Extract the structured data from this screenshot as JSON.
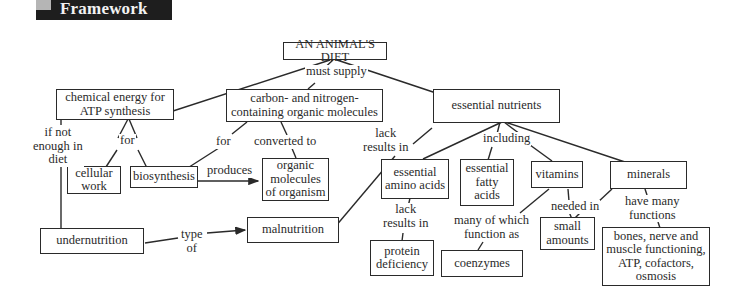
{
  "header": {
    "title": "Framework"
  },
  "nodes": {
    "diet": "AN ANIMAL'S DIET",
    "chem_energy": "chemical energy for\nATP synthesis",
    "carbon": "carbon- and nitrogen-\ncontaining organic molecules",
    "essential": "essential nutrients",
    "cellular": "cellular\nwork",
    "biosynthesis": "biosynthesis",
    "organic": "organic\nmolecules\nof organism",
    "amino": "essential\namino acids",
    "fatty": "essential\nfatty\nacids",
    "vitamins": "vitamins",
    "minerals": "minerals",
    "undernutrition": "undernutrition",
    "malnutrition": "malnutrition",
    "protein": "protein\ndeficiency",
    "coenzymes": "coenzymes",
    "small": "small\namounts",
    "bones": "bones, nerve and\nmuscle functioning,\nATP, cofactors,\nosmosis"
  },
  "links": {
    "must_supply": "must supply",
    "if_not": "if not\nenough in\ndiet",
    "for1": "for",
    "for2": "for",
    "converted": "converted to",
    "produces": "produces",
    "lack1": "lack\nresults in",
    "including": "including",
    "lack2": "lack\nresults in",
    "many": "many of which\nfunction as",
    "needed": "needed in",
    "have_many": "have many\nfunctions",
    "type_of": "type\nof"
  }
}
